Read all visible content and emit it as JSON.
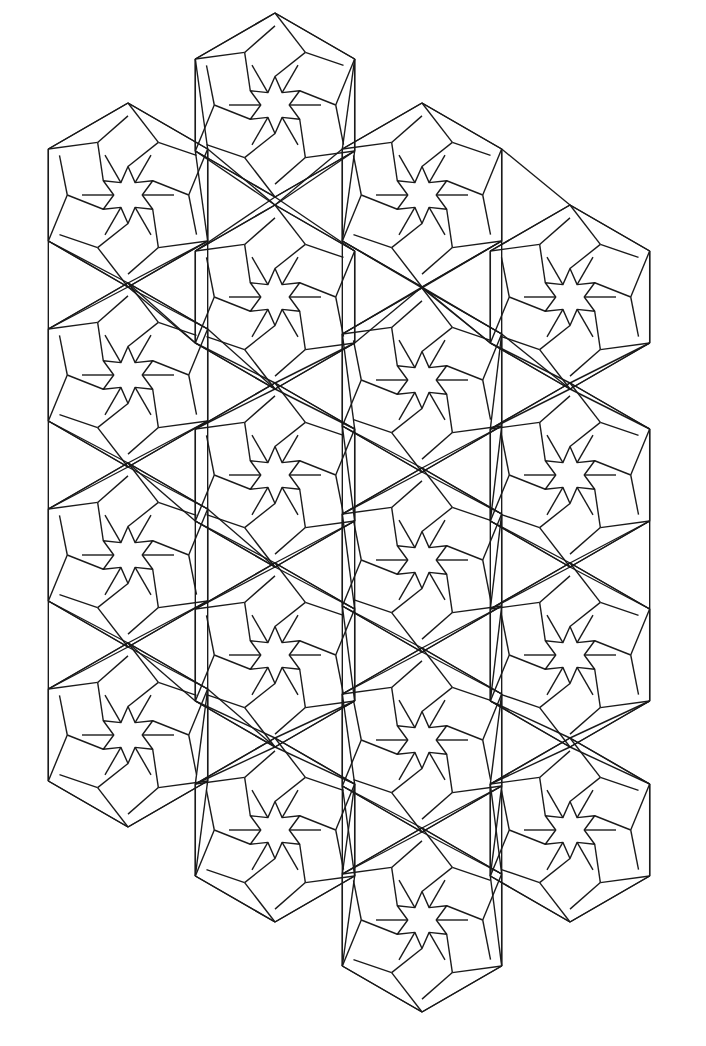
{
  "artwork": {
    "title": "Isometric hexagonal star tiling (line art)",
    "stroke_color": "#1a1a1a",
    "background": "#ffffff",
    "hex_radius": 92,
    "hexagons": [
      {
        "cx": 275,
        "cy": 105
      },
      {
        "cx": 128,
        "cy": 195
      },
      {
        "cx": 422,
        "cy": 195
      },
      {
        "cx": 275,
        "cy": 297
      },
      {
        "cx": 570,
        "cy": 297
      },
      {
        "cx": 128,
        "cy": 375
      },
      {
        "cx": 422,
        "cy": 380
      },
      {
        "cx": 275,
        "cy": 475
      },
      {
        "cx": 570,
        "cy": 475
      },
      {
        "cx": 128,
        "cy": 555
      },
      {
        "cx": 422,
        "cy": 560
      },
      {
        "cx": 275,
        "cy": 655
      },
      {
        "cx": 570,
        "cy": 655
      },
      {
        "cx": 128,
        "cy": 735
      },
      {
        "cx": 422,
        "cy": 740
      },
      {
        "cx": 275,
        "cy": 830
      },
      {
        "cx": 570,
        "cy": 830
      },
      {
        "cx": 422,
        "cy": 920
      }
    ]
  }
}
